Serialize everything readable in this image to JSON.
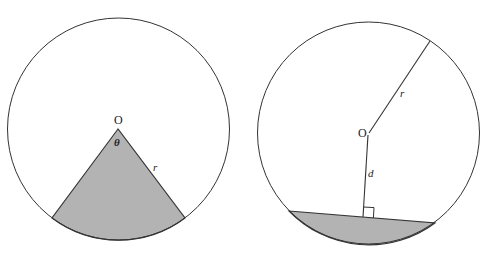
{
  "figures": [
    {
      "name": "sector",
      "labels": {
        "center": "O",
        "angle": "θ",
        "radius": "r"
      },
      "colors": {
        "stroke": "#333333",
        "fill": "#b3b3b3"
      }
    },
    {
      "name": "segment",
      "labels": {
        "center": "O",
        "radius": "r",
        "distance": "d"
      },
      "colors": {
        "stroke": "#333333",
        "fill": "#b3b3b3"
      }
    }
  ]
}
